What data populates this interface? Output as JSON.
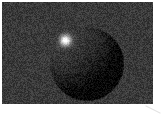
{
  "figure": {
    "canvas": {
      "width": 161,
      "height": 117,
      "background_color": "#ffffff"
    },
    "photo": {
      "x": 2,
      "y": 2,
      "width": 151,
      "height": 102,
      "base_gray": 58,
      "base_color": "#3a3a3a",
      "grain_amplitude": 20,
      "grain_seed": 42
    },
    "sphere": {
      "cx": 84.5,
      "cy": 61.5,
      "r": 37.5,
      "ambient_gray": 7,
      "diffuse_gray": 55,
      "dark_side_color": "#080808",
      "lit_side_color": "#3e3e3e",
      "light_dir": [
        -0.57,
        -0.63,
        0.53
      ],
      "edge_soft_px": 1.5
    },
    "highlight": {
      "x": 63,
      "y": 38,
      "sigma": 3.8,
      "intensity": 215,
      "core_color": "#f0f0f0"
    },
    "artifact_line": {
      "x1": 146,
      "y1": 106,
      "x2": 160,
      "y2": 113,
      "color": "#e4e4e4",
      "stroke_width": 1.2
    }
  }
}
